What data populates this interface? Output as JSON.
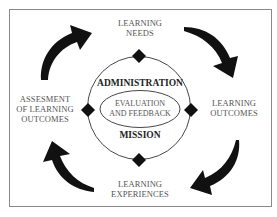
{
  "diagram": {
    "cycle_nodes": [
      {
        "id": "top",
        "lines": [
          "LEARNING",
          "NEEDS"
        ]
      },
      {
        "id": "right",
        "lines": [
          "LEARNING",
          "OUTCOMES"
        ]
      },
      {
        "id": "bottom",
        "lines": [
          "LEARNING",
          "EXPERIENCES"
        ]
      },
      {
        "id": "left",
        "lines": [
          "ASSESMENT",
          "OF LEARNING",
          "OUTCOMES"
        ]
      }
    ],
    "center": {
      "upper_label": "ADMINISTRATION",
      "lower_label": "MISSION",
      "core_lines": [
        "EVALUATION",
        "AND FEEDBACK"
      ]
    },
    "arrows": [
      {
        "from": "left",
        "to": "top",
        "direction": "clockwise"
      },
      {
        "from": "top",
        "to": "right",
        "direction": "clockwise"
      },
      {
        "from": "right",
        "to": "bottom",
        "direction": "clockwise"
      },
      {
        "from": "bottom",
        "to": "left",
        "direction": "clockwise"
      }
    ],
    "colors": {
      "arrow": "#111111",
      "diamond": "#111111",
      "circle_stroke": "#333333",
      "text": "#555555",
      "bold_text": "#222222",
      "frame": "#8a8a8a"
    }
  }
}
